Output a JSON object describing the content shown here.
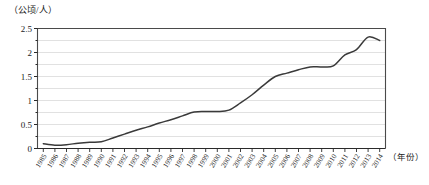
{
  "chart_data": {
    "type": "line",
    "title": "",
    "ylabel": "（公顷/人）",
    "xlabel": "（年份）",
    "ylim": [
      0,
      2.5
    ],
    "yticks": [
      "0",
      "0.5",
      "1",
      "1.5",
      "2",
      "2.5"
    ],
    "ytick_values": [
      0,
      0.5,
      1,
      1.5,
      2,
      2.5
    ],
    "gridlines": [
      0.25,
      0.5,
      0.75,
      1,
      1.25,
      1.5,
      1.75,
      2,
      2.25
    ],
    "grid": true,
    "legend": "none",
    "line_color": "#3a3a3a",
    "grid_color": "#d4d4d4",
    "axis_color": "#4a4a4a",
    "categories": [
      "1985",
      "1986",
      "1987",
      "1988",
      "1989",
      "1990",
      "1991",
      "1992",
      "1993",
      "1994",
      "1995",
      "1996",
      "1997",
      "1998",
      "1999",
      "2000",
      "2001",
      "2002",
      "2003",
      "2004",
      "2005",
      "2006",
      "2007",
      "2008",
      "2009",
      "2010",
      "2011",
      "2012",
      "2013",
      "2014"
    ],
    "values": [
      0.1,
      0.07,
      0.08,
      0.11,
      0.13,
      0.14,
      0.22,
      0.3,
      0.38,
      0.45,
      0.53,
      0.6,
      0.68,
      0.76,
      0.77,
      0.77,
      0.8,
      0.95,
      1.12,
      1.32,
      1.5,
      1.57,
      1.64,
      1.7,
      1.7,
      1.72,
      1.95,
      2.06,
      2.32,
      2.25
    ]
  }
}
